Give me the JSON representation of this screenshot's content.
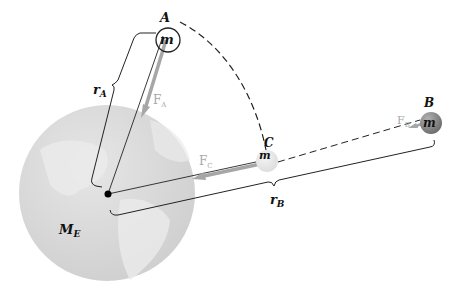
{
  "labels": {
    "point_a": "A",
    "point_b": "B",
    "point_c": "C",
    "mass_a": "m",
    "mass_b": "m",
    "mass_c": "m",
    "radius_a": "r",
    "radius_a_sub": "A",
    "radius_b": "r",
    "radius_b_sub": "B",
    "force_a": "F",
    "force_a_sub": "A",
    "force_b": "F",
    "force_b_sub": "B",
    "force_c": "F",
    "force_c_sub": "C",
    "earth_mass": "M",
    "earth_mass_sub": "E"
  },
  "colors": {
    "earth_fill": "#d9d9d9",
    "earth_land": "#ebebeb",
    "force_arrow": "#a6a6a6",
    "mass_b_fill": "#8a8a8a",
    "line": "#222222"
  }
}
